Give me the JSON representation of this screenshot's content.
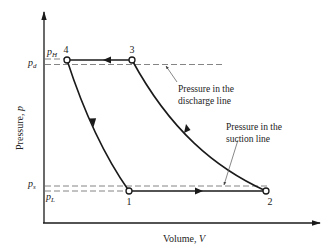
{
  "diagram": {
    "axes": {
      "y_label": "Pressure, ",
      "y_symbol": "p",
      "x_label": "Volume, ",
      "x_symbol": "V"
    },
    "pressure_levels": {
      "pH": {
        "symbol": "p",
        "subscript": "H"
      },
      "pd": {
        "symbol": "p",
        "subscript": "d"
      },
      "ps": {
        "symbol": "p",
        "subscript": "s"
      },
      "pL": {
        "symbol": "p",
        "subscript": "L"
      }
    },
    "states": [
      {
        "id": "1",
        "label": "1"
      },
      {
        "id": "2",
        "label": "2"
      },
      {
        "id": "3",
        "label": "3"
      },
      {
        "id": "4",
        "label": "4"
      }
    ],
    "annotations": {
      "discharge_line_1": "Pressure in the",
      "discharge_line_2": "discharge line",
      "suction_line_1": "Pressure in the",
      "suction_line_2": "suction line"
    },
    "colors": {
      "line": "#1a1a1a",
      "dashed": "#777777",
      "background": "#ffffff"
    }
  }
}
